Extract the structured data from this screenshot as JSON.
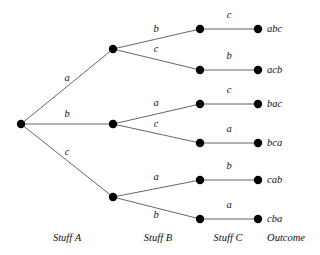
{
  "diagram": {
    "type": "probability-tree",
    "title": "",
    "background_color": "#ffffff",
    "node_color": "#000000",
    "edge_color": "#555555",
    "text_color": "#111111",
    "columns": [
      {
        "id": "stuff-a",
        "label": "Stuff A",
        "x": 67,
        "y": 238
      },
      {
        "id": "stuff-b",
        "label": "Stuff B",
        "x": 158,
        "y": 238
      },
      {
        "id": "stuff-c",
        "label": "Stuff C",
        "x": 228,
        "y": 238
      },
      {
        "id": "outcome",
        "label": "Outcome",
        "x": 286,
        "y": 238
      }
    ],
    "nodes": [
      {
        "id": "root",
        "x": 21,
        "y": 124,
        "r": 4.2
      },
      {
        "id": "b1",
        "x": 113,
        "y": 49,
        "r": 4.2
      },
      {
        "id": "b2",
        "x": 113,
        "y": 124,
        "r": 4.2
      },
      {
        "id": "b3",
        "x": 113,
        "y": 197,
        "r": 4.2
      },
      {
        "id": "c1",
        "x": 200,
        "y": 29,
        "r": 4.2
      },
      {
        "id": "c2",
        "x": 200,
        "y": 70,
        "r": 4.2
      },
      {
        "id": "c3",
        "x": 200,
        "y": 104,
        "r": 4.2
      },
      {
        "id": "c4",
        "x": 200,
        "y": 143,
        "r": 4.2
      },
      {
        "id": "c5",
        "x": 200,
        "y": 180,
        "r": 4.2
      },
      {
        "id": "c6",
        "x": 200,
        "y": 219,
        "r": 4.2
      },
      {
        "id": "o1",
        "x": 258,
        "y": 29,
        "r": 4.2
      },
      {
        "id": "o2",
        "x": 258,
        "y": 70,
        "r": 4.2
      },
      {
        "id": "o3",
        "x": 258,
        "y": 104,
        "r": 4.2
      },
      {
        "id": "o4",
        "x": 258,
        "y": 143,
        "r": 4.2
      },
      {
        "id": "o5",
        "x": 258,
        "y": 180,
        "r": 4.2
      },
      {
        "id": "o6",
        "x": 258,
        "y": 219,
        "r": 4.2
      }
    ],
    "edges": [
      {
        "id": "e-root-b1",
        "from": "root",
        "to": "b1",
        "x1": 21,
        "y1": 124,
        "x2": 113,
        "y2": 49,
        "label": "a",
        "lx": 67,
        "ly": 78
      },
      {
        "id": "e-root-b2",
        "from": "root",
        "to": "b2",
        "x1": 21,
        "y1": 124,
        "x2": 113,
        "y2": 124,
        "label": "b",
        "lx": 67,
        "ly": 114
      },
      {
        "id": "e-root-b3",
        "from": "root",
        "to": "b3",
        "x1": 21,
        "y1": 124,
        "x2": 113,
        "y2": 197,
        "label": "c",
        "lx": 67,
        "ly": 152
      },
      {
        "id": "e-b1-c1",
        "from": "b1",
        "to": "c1",
        "x1": 113,
        "y1": 49,
        "x2": 200,
        "y2": 29,
        "label": "b",
        "lx": 156,
        "ly": 29
      },
      {
        "id": "e-b1-c2",
        "from": "b1",
        "to": "c2",
        "x1": 113,
        "y1": 49,
        "x2": 200,
        "y2": 70,
        "label": "c",
        "lx": 156,
        "ly": 49
      },
      {
        "id": "e-b2-c3",
        "from": "b2",
        "to": "c3",
        "x1": 113,
        "y1": 124,
        "x2": 200,
        "y2": 104,
        "label": "a",
        "lx": 156,
        "ly": 103
      },
      {
        "id": "e-b2-c4",
        "from": "b2",
        "to": "c4",
        "x1": 113,
        "y1": 124,
        "x2": 200,
        "y2": 143,
        "label": "c",
        "lx": 156,
        "ly": 124
      },
      {
        "id": "e-b3-c5",
        "from": "b3",
        "to": "c5",
        "x1": 113,
        "y1": 197,
        "x2": 200,
        "y2": 180,
        "label": "a",
        "lx": 156,
        "ly": 177
      },
      {
        "id": "e-b3-c6",
        "from": "b3",
        "to": "c6",
        "x1": 113,
        "y1": 197,
        "x2": 200,
        "y2": 219,
        "label": "b",
        "lx": 156,
        "ly": 215
      },
      {
        "id": "e-c1-o1",
        "from": "c1",
        "to": "o1",
        "x1": 200,
        "y1": 29,
        "x2": 258,
        "y2": 29,
        "label": "c",
        "lx": 229,
        "ly": 15
      },
      {
        "id": "e-c2-o2",
        "from": "c2",
        "to": "o2",
        "x1": 200,
        "y1": 70,
        "x2": 258,
        "y2": 70,
        "label": "b",
        "lx": 229,
        "ly": 56
      },
      {
        "id": "e-c3-o3",
        "from": "c3",
        "to": "o3",
        "x1": 200,
        "y1": 104,
        "x2": 258,
        "y2": 104,
        "label": "c",
        "lx": 229,
        "ly": 90
      },
      {
        "id": "e-c4-o4",
        "from": "c4",
        "to": "o4",
        "x1": 200,
        "y1": 143,
        "x2": 258,
        "y2": 143,
        "label": "a",
        "lx": 229,
        "ly": 129
      },
      {
        "id": "e-c5-o5",
        "from": "c5",
        "to": "o5",
        "x1": 200,
        "y1": 180,
        "x2": 258,
        "y2": 180,
        "label": "b",
        "lx": 229,
        "ly": 166
      },
      {
        "id": "e-c6-o6",
        "from": "c6",
        "to": "o6",
        "x1": 200,
        "y1": 219,
        "x2": 258,
        "y2": 219,
        "label": "a",
        "lx": 229,
        "ly": 205
      }
    ],
    "outcomes": [
      {
        "id": "outcome-abc",
        "label": "abc",
        "x": 267,
        "y": 29
      },
      {
        "id": "outcome-acb",
        "label": "acb",
        "x": 267,
        "y": 70
      },
      {
        "id": "outcome-bac",
        "label": "bac",
        "x": 267,
        "y": 104
      },
      {
        "id": "outcome-bca",
        "label": "bca",
        "x": 267,
        "y": 143
      },
      {
        "id": "outcome-cab",
        "label": "cab",
        "x": 267,
        "y": 180
      },
      {
        "id": "outcome-cba",
        "label": "cba",
        "x": 267,
        "y": 219
      }
    ]
  }
}
